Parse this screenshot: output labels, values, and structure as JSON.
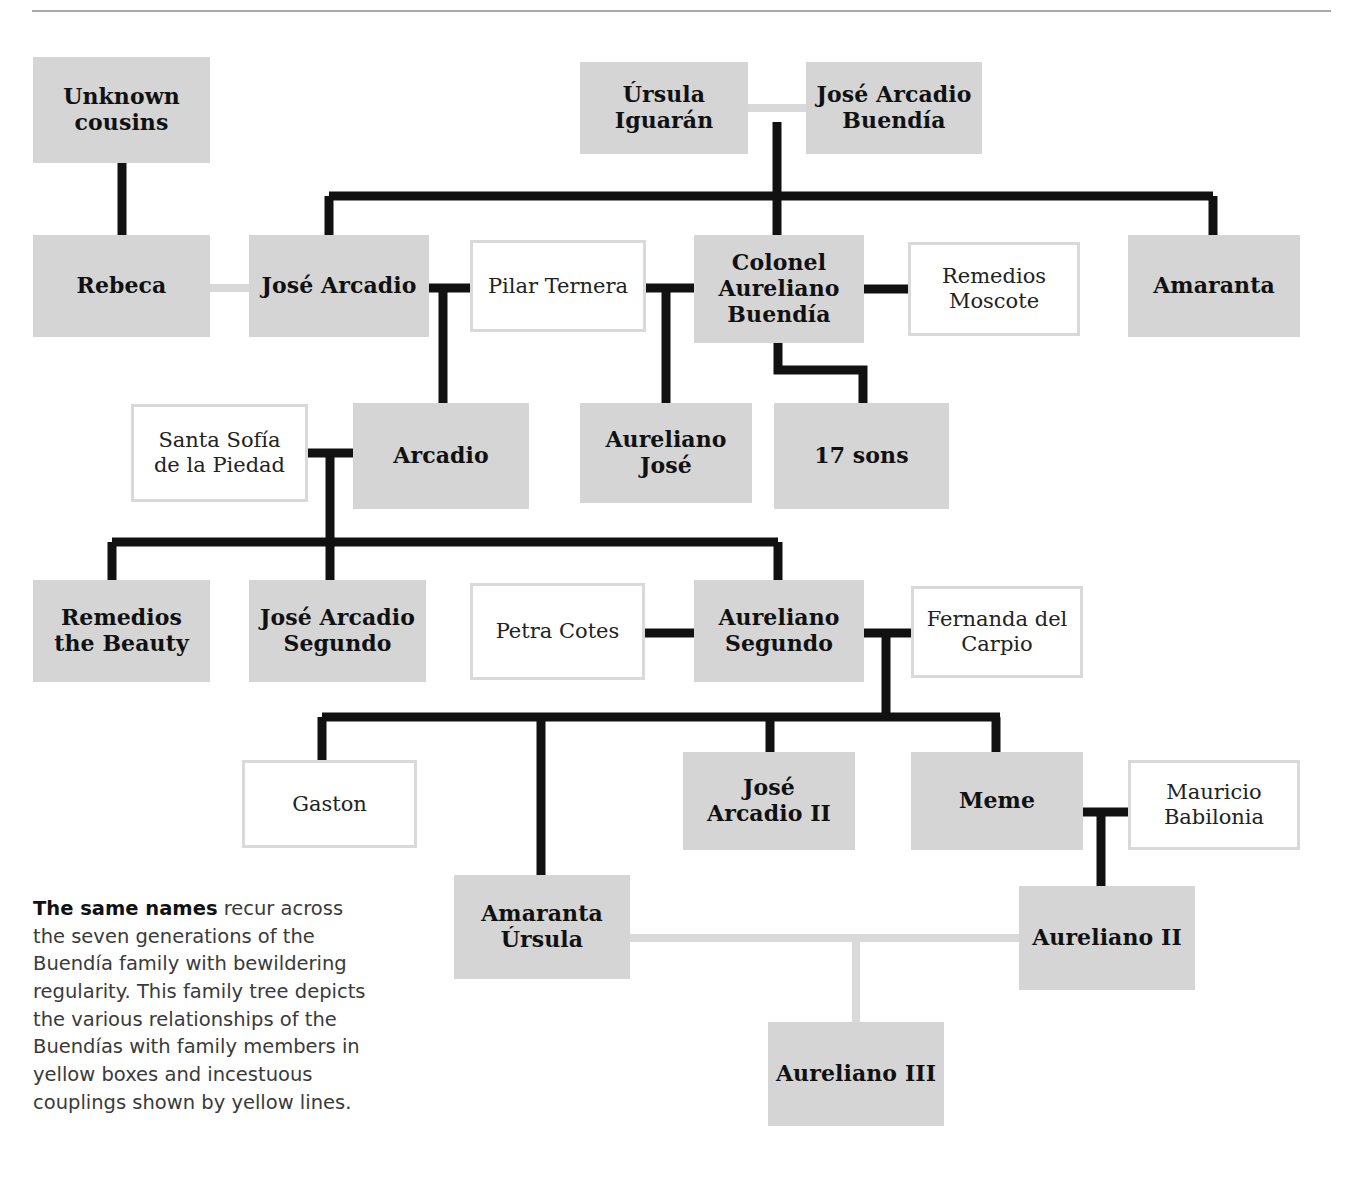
{
  "figure": {
    "title_rule": true,
    "colors": {
      "family_box_fill": "#d5d5d5",
      "outsider_box_fill": "#ffffff",
      "outsider_box_border": "#d9d9d9",
      "descent_line": "#111111",
      "incest_line": "#d9d9d9",
      "rule": "#a9a9a9",
      "text": "#111111"
    }
  },
  "caption": {
    "lead": "The same names",
    "body": " recur across the seven generations of the Buendía family with bewildering regularity. This family tree depicts the various relationships of the Buendías with family members in yellow boxes and incestuous couplings shown by yellow lines."
  },
  "nodes": [
    {
      "id": "unknown-cousins",
      "name": "Unknown\ncousins",
      "kind": "family",
      "x": 33,
      "y": 57,
      "w": 177,
      "h": 106
    },
    {
      "id": "ursula-iguaran",
      "name": "Úrsula\nIguarán",
      "kind": "family",
      "x": 580,
      "y": 62,
      "w": 168,
      "h": 92
    },
    {
      "id": "jose-arcadio-buendia",
      "name": "José Arcadio\nBuendía",
      "kind": "family",
      "x": 806,
      "y": 62,
      "w": 176,
      "h": 92
    },
    {
      "id": "rebeca",
      "name": "Rebeca",
      "kind": "family",
      "x": 33,
      "y": 235,
      "w": 177,
      "h": 102
    },
    {
      "id": "jose-arcadio",
      "name": "José Arcadio",
      "kind": "family",
      "x": 249,
      "y": 235,
      "w": 180,
      "h": 102
    },
    {
      "id": "pilar-ternera",
      "name": "Pilar Ternera",
      "kind": "outsider",
      "x": 470,
      "y": 240,
      "w": 176,
      "h": 92
    },
    {
      "id": "colonel-aureliano",
      "name": "Colonel\nAureliano\nBuendía",
      "kind": "family",
      "x": 694,
      "y": 235,
      "w": 170,
      "h": 108
    },
    {
      "id": "remedios-moscote",
      "name": "Remedios\nMoscote",
      "kind": "outsider",
      "x": 908,
      "y": 242,
      "w": 172,
      "h": 94
    },
    {
      "id": "amaranta",
      "name": "Amaranta",
      "kind": "family",
      "x": 1128,
      "y": 235,
      "w": 172,
      "h": 102
    },
    {
      "id": "santa-sofia",
      "name": "Santa Sofía\nde la Piedad",
      "kind": "outsider",
      "x": 131,
      "y": 404,
      "w": 177,
      "h": 98
    },
    {
      "id": "arcadio",
      "name": "Arcadio",
      "kind": "family",
      "x": 353,
      "y": 403,
      "w": 176,
      "h": 106
    },
    {
      "id": "aureliano-jose",
      "name": "Aureliano\nJosé",
      "kind": "family",
      "x": 580,
      "y": 403,
      "w": 172,
      "h": 100
    },
    {
      "id": "17-sons",
      "name": "17 sons",
      "kind": "family",
      "x": 774,
      "y": 403,
      "w": 175,
      "h": 106
    },
    {
      "id": "remedios-beauty",
      "name": "Remedios\nthe Beauty",
      "kind": "family",
      "x": 33,
      "y": 580,
      "w": 177,
      "h": 102
    },
    {
      "id": "jose-arcadio-segundo",
      "name": "José Arcadio\nSegundo",
      "kind": "family",
      "x": 249,
      "y": 580,
      "w": 177,
      "h": 102
    },
    {
      "id": "petra-cotes",
      "name": "Petra Cotes",
      "kind": "outsider",
      "x": 470,
      "y": 583,
      "w": 175,
      "h": 97
    },
    {
      "id": "aureliano-segundo",
      "name": "Aureliano\nSegundo",
      "kind": "family",
      "x": 694,
      "y": 580,
      "w": 170,
      "h": 102
    },
    {
      "id": "fernanda-del-carpio",
      "name": "Fernanda del\nCarpio",
      "kind": "outsider",
      "x": 911,
      "y": 586,
      "w": 172,
      "h": 92
    },
    {
      "id": "gaston",
      "name": "Gaston",
      "kind": "outsider",
      "x": 242,
      "y": 760,
      "w": 175,
      "h": 88
    },
    {
      "id": "jose-arcadio-ii",
      "name": "José\nArcadio II",
      "kind": "family",
      "x": 683,
      "y": 752,
      "w": 172,
      "h": 98
    },
    {
      "id": "meme",
      "name": "Meme",
      "kind": "family",
      "x": 911,
      "y": 752,
      "w": 172,
      "h": 98
    },
    {
      "id": "mauricio-babilonia",
      "name": "Mauricio\nBabilonia",
      "kind": "outsider",
      "x": 1128,
      "y": 760,
      "w": 172,
      "h": 90
    },
    {
      "id": "amaranta-ursula",
      "name": "Amaranta\nÚrsula",
      "kind": "family",
      "x": 454,
      "y": 875,
      "w": 176,
      "h": 104
    },
    {
      "id": "aureliano-ii",
      "name": "Aureliano II",
      "kind": "family",
      "x": 1019,
      "y": 886,
      "w": 176,
      "h": 104
    },
    {
      "id": "aureliano-iii",
      "name": "Aureliano III",
      "kind": "family",
      "x": 768,
      "y": 1022,
      "w": 176,
      "h": 104
    }
  ],
  "relationships": {
    "couplings_incestuous": [
      {
        "from": "ursula-iguaran",
        "to": "jose-arcadio-buendia"
      },
      {
        "from": "rebeca",
        "to": "jose-arcadio"
      },
      {
        "from": "amaranta-ursula",
        "to": "aureliano-ii"
      }
    ],
    "couplings": [
      {
        "from": "jose-arcadio",
        "to": "pilar-ternera"
      },
      {
        "from": "pilar-ternera",
        "to": "colonel-aureliano"
      },
      {
        "from": "colonel-aureliano",
        "to": "remedios-moscote"
      },
      {
        "from": "santa-sofia",
        "to": "arcadio"
      },
      {
        "from": "petra-cotes",
        "to": "aureliano-segundo"
      },
      {
        "from": "aureliano-segundo",
        "to": "fernanda-del-carpio"
      },
      {
        "from": "meme",
        "to": "mauricio-babilonia"
      }
    ],
    "descent": [
      {
        "parents": [
          "ursula-iguaran",
          "jose-arcadio-buendia"
        ],
        "children": [
          "jose-arcadio",
          "colonel-aureliano",
          "amaranta"
        ]
      },
      {
        "parents": [
          "jose-arcadio",
          "pilar-ternera"
        ],
        "children": [
          "arcadio"
        ]
      },
      {
        "parents": [
          "pilar-ternera",
          "colonel-aureliano"
        ],
        "children": [
          "aureliano-jose"
        ]
      },
      {
        "parents": [
          "colonel-aureliano"
        ],
        "children": [
          "17-sons"
        ]
      },
      {
        "parents": [
          "santa-sofia",
          "arcadio"
        ],
        "children": [
          "remedios-beauty",
          "jose-arcadio-segundo",
          "aureliano-segundo"
        ]
      },
      {
        "parents": [
          "aureliano-segundo",
          "fernanda-del-carpio"
        ],
        "children": [
          "gaston",
          "amaranta-ursula",
          "jose-arcadio-ii",
          "meme"
        ]
      },
      {
        "parents": [
          "meme",
          "mauricio-babilonia"
        ],
        "children": [
          "aureliano-ii"
        ]
      },
      {
        "parents": [
          "amaranta-ursula",
          "aureliano-ii"
        ],
        "children": [
          "aureliano-iii"
        ]
      }
    ]
  }
}
